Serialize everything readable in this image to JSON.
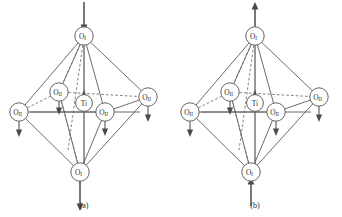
{
  "figure": {
    "background_color": "#ffffff",
    "line_color": "#5b5b5b",
    "arrow_color": "#4a4a4a",
    "node_fill": "#ffffff"
  },
  "panels": [
    {
      "id": "a",
      "caption": "(a)",
      "nodes": {
        "apex_top": {
          "label": "O",
          "subscript": "I",
          "name": "oxygen-axial-top"
        },
        "apex_bottom": {
          "label": "O",
          "subscript": "I",
          "name": "oxygen-axial-bottom"
        },
        "eq_left": {
          "label": "O",
          "subscript": "II",
          "name": "oxygen-equatorial-left"
        },
        "eq_right": {
          "label": "O",
          "subscript": "II",
          "name": "oxygen-equatorial-right"
        },
        "eq_back": {
          "label": "O",
          "subscript": "II",
          "name": "oxygen-equatorial-back"
        },
        "eq_front": {
          "label": "O",
          "subscript": "II",
          "name": "oxygen-equatorial-front"
        },
        "center": {
          "label": "Ti",
          "subscript": "",
          "name": "titanium-center"
        }
      },
      "arrows": {
        "apex_top": "down",
        "apex_bottom": "down",
        "eq_left": "down",
        "eq_right": "down",
        "eq_back": "down",
        "eq_front": "down",
        "center": "up"
      }
    },
    {
      "id": "b",
      "caption": "(b)",
      "nodes": {
        "apex_top": {
          "label": "O",
          "subscript": "I",
          "name": "oxygen-axial-top"
        },
        "apex_bottom": {
          "label": "O",
          "subscript": "I",
          "name": "oxygen-axial-bottom"
        },
        "eq_left": {
          "label": "O",
          "subscript": "II",
          "name": "oxygen-equatorial-left"
        },
        "eq_right": {
          "label": "O",
          "subscript": "II",
          "name": "oxygen-equatorial-right"
        },
        "eq_back": {
          "label": "O",
          "subscript": "II",
          "name": "oxygen-equatorial-back"
        },
        "eq_front": {
          "label": "O",
          "subscript": "II",
          "name": "oxygen-equatorial-front"
        },
        "center": {
          "label": "Ti",
          "subscript": "",
          "name": "titanium-center"
        }
      },
      "arrows": {
        "apex_top": "up",
        "apex_bottom": "up",
        "eq_left": "down",
        "eq_right": "down",
        "eq_back": "down",
        "eq_front": "down",
        "center": "up"
      }
    }
  ]
}
